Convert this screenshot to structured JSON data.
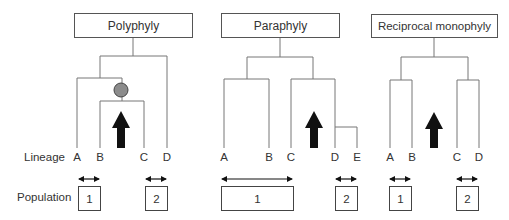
{
  "row_labels": {
    "lineage": "Lineage",
    "population": "Population"
  },
  "colors": {
    "line": "#777777",
    "arrow": "#111111",
    "node_fill": "#8c8c8c",
    "node_stroke": "#444444",
    "box_border": "#555555"
  },
  "panels": [
    {
      "title": "Polyphyly",
      "lineages": [
        "A",
        "B",
        "C",
        "D"
      ],
      "populations": [
        {
          "label": "1",
          "members": [
            "A",
            "B"
          ]
        },
        {
          "label": "2",
          "members": [
            "C",
            "D"
          ]
        }
      ],
      "has_ancestral_node": true
    },
    {
      "title": "Paraphyly",
      "lineages": [
        "A",
        "B",
        "C",
        "D",
        "E"
      ],
      "populations": [
        {
          "label": "1",
          "members": [
            "A",
            "B",
            "C"
          ]
        },
        {
          "label": "2",
          "members": [
            "D",
            "E"
          ]
        }
      ],
      "has_ancestral_node": false
    },
    {
      "title": "Reciprocal monophyly",
      "lineages": [
        "A",
        "B",
        "C",
        "D"
      ],
      "populations": [
        {
          "label": "1",
          "members": [
            "A",
            "B"
          ]
        },
        {
          "label": "2",
          "members": [
            "C",
            "D"
          ]
        }
      ],
      "has_ancestral_node": false
    }
  ]
}
